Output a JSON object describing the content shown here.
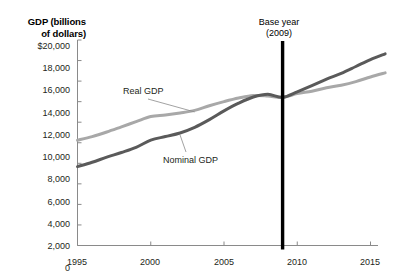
{
  "chart_data": {
    "type": "line",
    "title": "GDP (billions of dollars)",
    "xlabel": "",
    "ylabel": "GDP (billions of dollars)",
    "xlim": [
      1995,
      2016
    ],
    "ylim": [
      0,
      20000
    ],
    "grid": false,
    "legend_position": "inline-annotations",
    "y_ticks": [
      "$20,000",
      "18,000",
      "16,000",
      "14,000",
      "12,000",
      "10,000",
      "8,000",
      "6,000",
      "4,000",
      "2,000",
      "0"
    ],
    "y_tick_values": [
      20000,
      18000,
      16000,
      14000,
      12000,
      10000,
      8000,
      6000,
      4000,
      2000,
      0
    ],
    "x_ticks": [
      "1995",
      "2000",
      "2005",
      "2010",
      "2015"
    ],
    "x_tick_values": [
      1995,
      2000,
      2005,
      2010,
      2015
    ],
    "x": [
      1995,
      1996,
      1997,
      1998,
      1999,
      2000,
      2001,
      2002,
      2003,
      2004,
      2005,
      2006,
      2007,
      2008,
      2009,
      2010,
      2011,
      2012,
      2013,
      2014,
      2015,
      2016
    ],
    "series": [
      {
        "name": "Real GDP",
        "color": "#a8a8a8",
        "values": [
          10250,
          10600,
          11050,
          11550,
          12050,
          12550,
          12700,
          12900,
          13150,
          13600,
          14000,
          14350,
          14600,
          14550,
          14420,
          14780,
          15020,
          15350,
          15600,
          15950,
          16400,
          16800
        ]
      },
      {
        "name": "Nominal GDP",
        "color": "#5a5a5a",
        "values": [
          7680,
          8100,
          8600,
          9050,
          9550,
          10250,
          10600,
          10950,
          11500,
          12250,
          13100,
          13850,
          14450,
          14720,
          14420,
          14960,
          15550,
          16200,
          16750,
          17420,
          18100,
          18650
        ]
      }
    ],
    "annotations": [
      {
        "name": "base-year",
        "text": "Base year\n(2009)",
        "x_value": 2009,
        "marker": "vertical-line",
        "color": "#000000"
      },
      {
        "name": "real-gdp-callout",
        "text": "Real GDP",
        "points_to_x": 2003,
        "points_to_y": 12900
      },
      {
        "name": "nominal-gdp-callout",
        "text": "Nominal GDP",
        "points_to_x": 2002,
        "points_to_y": 10950
      }
    ]
  },
  "labels": {
    "axis_title": "GDP (billions\nof dollars)",
    "base_year": "Base year\n(2009)",
    "real_gdp": "Real GDP",
    "nominal_gdp": "Nominal GDP",
    "y_0": "$20,000",
    "y_1": "18,000",
    "y_2": "16,000",
    "y_3": "14,000",
    "y_4": "12,000",
    "y_5": "10,000",
    "y_6": "8,000",
    "y_7": "6,000",
    "y_8": "4,000",
    "y_9": "2,000",
    "y_10": "0",
    "x_0": "1995",
    "x_1": "2000",
    "x_2": "2005",
    "x_3": "2010",
    "x_4": "2015"
  }
}
